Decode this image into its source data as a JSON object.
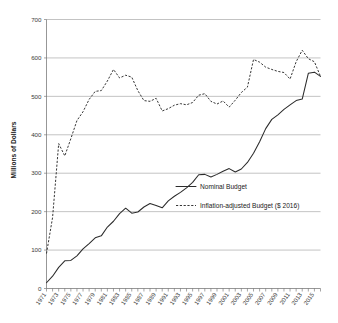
{
  "chart_data": {
    "type": "line",
    "title": "",
    "xlabel": "",
    "ylabel": "Millions of Dollars",
    "ylim": [
      0,
      700
    ],
    "ytick_step": 100,
    "yticks": [
      "0",
      "100",
      "200",
      "300",
      "400",
      "500",
      "600",
      "700"
    ],
    "grid": true,
    "legend_position": "center-right",
    "xlim": [
      1971,
      2016
    ],
    "x": [
      1971,
      1972,
      1973,
      1974,
      1975,
      1976,
      1977,
      1978,
      1979,
      1980,
      1981,
      1982,
      1983,
      1984,
      1985,
      1986,
      1987,
      1988,
      1989,
      1990,
      1991,
      1992,
      1993,
      1994,
      1995,
      1996,
      1997,
      1998,
      1999,
      2000,
      2001,
      2002,
      2003,
      2004,
      2005,
      2006,
      2007,
      2008,
      2009,
      2010,
      2011,
      2012,
      2013,
      2014,
      2015,
      2016
    ],
    "xtick_labels": [
      "1971",
      "1973",
      "1975",
      "1977",
      "1979",
      "1981",
      "1983",
      "1985",
      "1987",
      "1989",
      "1991",
      "1993",
      "1995",
      "1997",
      "1999",
      "2001",
      "2003",
      "2005",
      "2007",
      "2009",
      "2011",
      "2013",
      "2015"
    ],
    "series": [
      {
        "name": "Nominal Budget",
        "style": "solid",
        "color": "#2b2b2b",
        "values": [
          15,
          32,
          55,
          72,
          73,
          85,
          103,
          117,
          132,
          137,
          160,
          175,
          195,
          209,
          196,
          199,
          212,
          221,
          216,
          210,
          228,
          240,
          250,
          262,
          276,
          296,
          297,
          290,
          297,
          305,
          312,
          303,
          311,
          328,
          352,
          382,
          416,
          440,
          452,
          466,
          478,
          489,
          493,
          560,
          563,
          552
        ]
      },
      {
        "name": "Inflation-adjusted Budget ($ 2016)",
        "style": "dashed",
        "color": "#2b2b2b",
        "values": [
          91,
          185,
          377,
          345,
          390,
          437,
          460,
          492,
          513,
          515,
          540,
          570,
          548,
          555,
          550,
          515,
          489,
          487,
          495,
          462,
          468,
          477,
          481,
          478,
          484,
          503,
          507,
          487,
          480,
          488,
          472,
          490,
          510,
          524,
          596,
          589,
          576,
          570,
          565,
          562,
          545,
          590,
          620,
          598,
          590,
          552
        ]
      }
    ],
    "nominal_pixel_path": "M 47.0,285.5 L 52.7,278.8 L 58.5,269.5 L 64.2,263.2 L 70.0,262.8 L 75.7,258.0 L 81.5,251.0 L 87.2,245.6 L 93.0,239.8 L 98.7,237.8 L 104.5,228.0 L 110.2,222.0 L 116.0,214.5 L 121.7,208.8 L 127.5,213.8 L 133.2,212.6 L 139.0,207.6 L 144.7,204.0 L 150.5,205.9 L 156.2,208.2 L 162.0,201.2 L 167.7,196.6 L 173.5,192.8 L 179.2,188.2 L 185.0,183.0 L 190.7,175.3 L 196.5,175.0 L 202.2,177.7 L 208.0,175.3 L 213.7,172.2 L 219.5,169.5 L 225.2,173.0 L 231.0,170.0 L 236.7,163.4 L 242.5,154.2 L 248.2,142.7 L 254.0,129.7 L 259.7,120.5 L 265.5,115.9 L 271.2,110.5 L 277.0,105.9 L 282.7,101.7 L 288.5,100.2 L 294.2,74.6 L 300.0,73.4 L 305.7,77.6",
    "inflation_pixel_path": "M 47.0,256.4 L 52.7,220.5 L 58.5,147.0 L 64.2,159.3 L 70.0,142.1 L 75.7,124.1 L 81.5,115.3 L 87.2,103.0 L 93.0,95.0 L 98.7,94.3 L 104.5,84.7 L 110.2,73.2 L 116.0,81.6 L 121.7,78.9 L 127.5,80.8 L 133.2,94.3 L 139.0,104.2 L 144.7,105.0 L 150.5,101.9 L 156.2,114.5 L 162.0,112.2 L 167.7,108.8 L 173.5,107.2 L 179.2,108.3 L 185.0,106.0 L 190.7,98.8 L 196.5,97.2 L 202.2,104.9 L 208.0,107.6 L 213.7,104.5 L 219.5,110.6 L 225.2,103.8 L 231.0,96.2 L 236.7,90.8 L 242.5,63.2 L 248.2,65.9 L 254.0,70.9 L 259.7,73.2 L 265.5,75.2 L 271.2,76.3 L 277.0,82.8 L 282.7,65.6 L 288.5,54.1 L 294.2,62.5 L 300.0,65.6 L 305.7,80.2"
  },
  "legend": {
    "items": [
      {
        "label": "Nominal Budget",
        "style": "solid"
      },
      {
        "label": "Inflation-adjusted Budget ($ 2016)",
        "style": "dashed"
      }
    ]
  }
}
